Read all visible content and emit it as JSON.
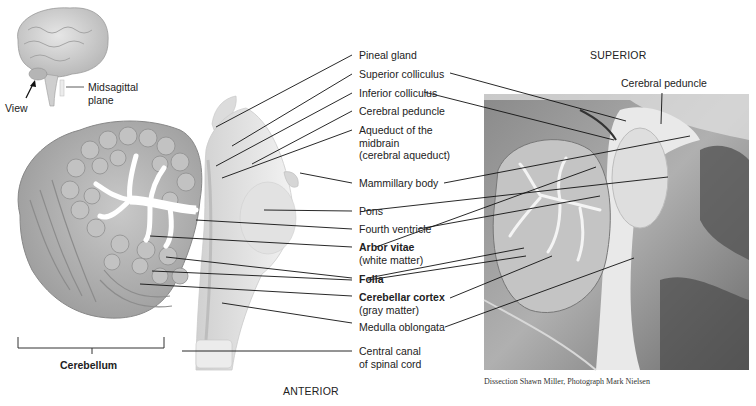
{
  "figure": {
    "orientation": {
      "top": "SUPERIOR",
      "bottom": "ANTERIOR"
    },
    "credit": "Dissection Shawn Miller, Photograph Mark Nielsen",
    "inset": {
      "view_label": "View",
      "plane_label_1": "Midsagittal",
      "plane_label_2": "plane"
    },
    "bracket_label": "Cerebellum",
    "photo_labels": {
      "cerebral_peduncle": "Cerebral peduncle"
    },
    "labels": [
      {
        "id": "pineal",
        "line1": "Pineal gland",
        "line2": "",
        "line3": "",
        "bold": false
      },
      {
        "id": "sup-coll",
        "line1": "Superior colliculus",
        "line2": "",
        "line3": "",
        "bold": false
      },
      {
        "id": "inf-coll",
        "line1": "Inferior colliculus",
        "line2": "",
        "line3": "",
        "bold": false
      },
      {
        "id": "cer-ped",
        "line1": "Cerebral peduncle",
        "line2": "",
        "line3": "",
        "bold": false
      },
      {
        "id": "aqueduct",
        "line1": "Aqueduct of the",
        "line2": "midbrain",
        "line3": "(cerebral aqueduct)",
        "bold": false
      },
      {
        "id": "mammillary",
        "line1": "Mammillary body",
        "line2": "",
        "line3": "",
        "bold": false
      },
      {
        "id": "pons",
        "line1": "Pons",
        "line2": "",
        "line3": "",
        "bold": false
      },
      {
        "id": "fourth-vent",
        "line1": "Fourth ventricle",
        "line2": "",
        "line3": "",
        "bold": false
      },
      {
        "id": "arbor",
        "line1": "Arbor vitae",
        "line2": "(white matter)",
        "line3": "",
        "bold": true
      },
      {
        "id": "folia",
        "line1": "Folia",
        "line2": "",
        "line3": "",
        "bold": true
      },
      {
        "id": "cortex",
        "line1": "Cerebellar cortex",
        "line2": "(gray matter)",
        "line3": "",
        "bold": true
      },
      {
        "id": "medulla",
        "line1": "Medulla oblongata",
        "line2": "",
        "line3": "",
        "bold": false
      },
      {
        "id": "central-canal",
        "line1": "Central canal",
        "line2": "of spinal cord",
        "line3": "",
        "bold": false
      }
    ]
  }
}
